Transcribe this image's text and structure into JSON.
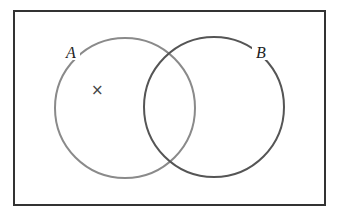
{
  "diagram": {
    "type": "venn",
    "universe": {
      "x": 14,
      "y": 11,
      "width": 311,
      "height": 194,
      "stroke": "#333333"
    },
    "sets": [
      {
        "label": "A",
        "cx": 125,
        "cy": 108,
        "r": 70,
        "stroke": "#8a8a8a",
        "label_x": 68,
        "label_y": 58
      },
      {
        "label": "B",
        "cx": 214,
        "cy": 107,
        "r": 70,
        "stroke": "#555555",
        "label_x": 256,
        "label_y": 58
      }
    ],
    "marker": {
      "symbol": "×",
      "x": 97,
      "y": 95,
      "region": "A only"
    }
  }
}
